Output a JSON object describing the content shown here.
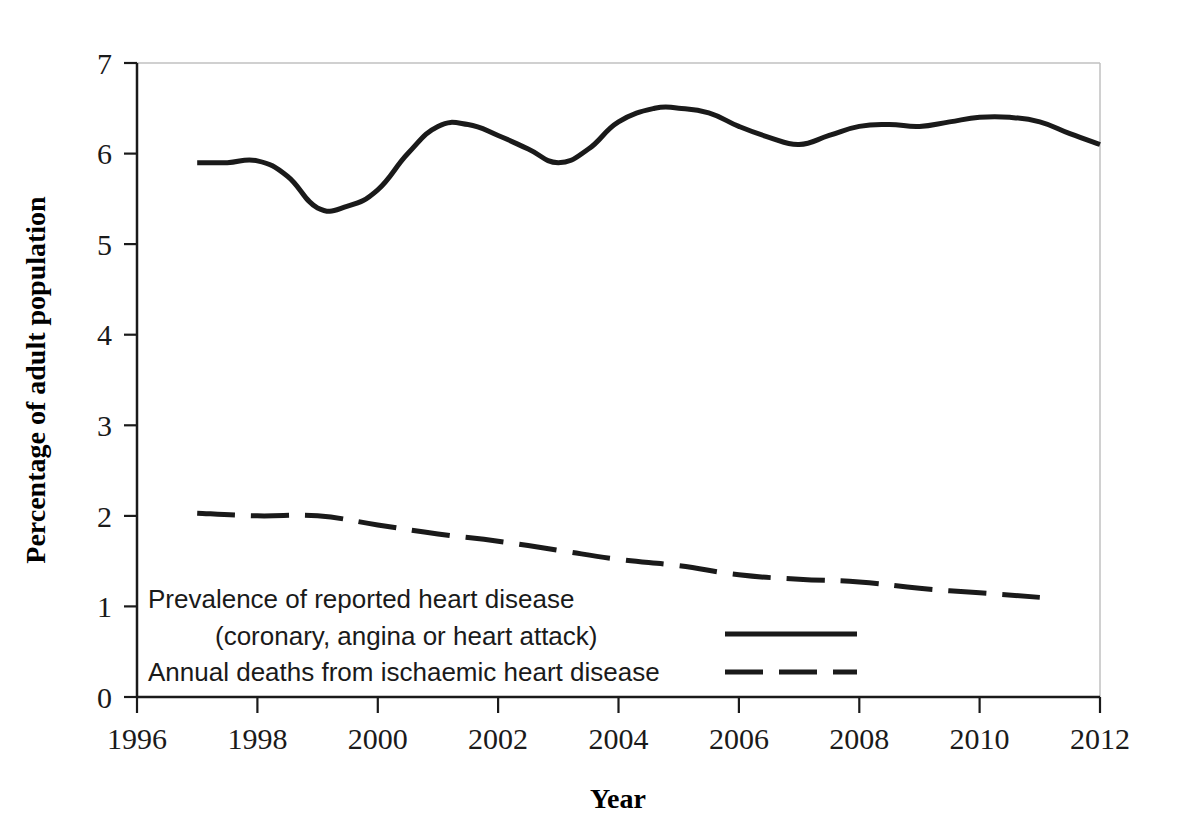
{
  "chart_data": {
    "type": "line",
    "title": "",
    "subtitle": "",
    "xlabel": "Year",
    "ylabel": "Percentage of adult population",
    "xlim": [
      1996,
      2012
    ],
    "ylim": [
      0,
      7
    ],
    "xticks": [
      "1996",
      "1998",
      "2000",
      "2002",
      "2004",
      "2006",
      "2008",
      "2010",
      "2012"
    ],
    "xtick_values": [
      1996,
      1998,
      2000,
      2002,
      2004,
      2006,
      2008,
      2010,
      2012
    ],
    "yticks": [
      "0",
      "1",
      "2",
      "3",
      "4",
      "5",
      "6",
      "7"
    ],
    "ytick_values": [
      0,
      1,
      2,
      3,
      4,
      5,
      6,
      7
    ],
    "grid": false,
    "legend_position": "inside-bottom-left",
    "series": [
      {
        "name": "Prevalence of reported heart disease (coronary, angina or heart attack)",
        "style": "solid",
        "color": "#1a1a1a",
        "x": [
          1997,
          1997.5,
          1998,
          1998.5,
          1999,
          1999.5,
          2000,
          2000.5,
          2001,
          2001.5,
          2002,
          2002.5,
          2003,
          2003.5,
          2004,
          2004.6,
          2005,
          2005.5,
          2006,
          2006.5,
          2007,
          2007.5,
          2008,
          2008.5,
          2009,
          2009.5,
          2010,
          2010.5,
          2011,
          2011.5,
          2012
        ],
        "y": [
          5.9,
          5.9,
          5.92,
          5.75,
          5.4,
          5.42,
          5.6,
          6.0,
          6.3,
          6.32,
          6.2,
          6.05,
          5.9,
          6.05,
          6.35,
          6.5,
          6.5,
          6.45,
          6.3,
          6.18,
          6.1,
          6.2,
          6.3,
          6.32,
          6.3,
          6.35,
          6.4,
          6.4,
          6.35,
          6.22,
          6.1
        ]
      },
      {
        "name": "Annual deaths from ischaemic heart disease",
        "style": "dashed",
        "color": "#1a1a1a",
        "x": [
          1997,
          1998,
          1999,
          2000,
          2001,
          2002,
          2003,
          2004,
          2005,
          2006,
          2007,
          2008,
          2009,
          2010,
          2011
        ],
        "y": [
          2.03,
          2.0,
          2.0,
          1.9,
          1.8,
          1.72,
          1.62,
          1.52,
          1.45,
          1.35,
          1.3,
          1.27,
          1.2,
          1.15,
          1.1
        ]
      }
    ]
  },
  "legend": {
    "line1": "Prevalence of reported heart disease",
    "line2": "(coronary, angina or heart attack)",
    "line3": "Annual deaths from ischaemic heart disease"
  },
  "axes": {
    "y_title": "Percentage of adult population",
    "x_title": "Year",
    "y_labels": [
      "7",
      "6",
      "5",
      "4",
      "3",
      "2",
      "1",
      "0"
    ],
    "x_labels": [
      "1996",
      "1998",
      "2000",
      "2002",
      "2004",
      "2006",
      "2008",
      "2010",
      "2012"
    ]
  },
  "colors": {
    "line": "#1a1a1a",
    "frame": "#b0b0b0",
    "axis": "#1a1a1a",
    "background": "#ffffff"
  }
}
